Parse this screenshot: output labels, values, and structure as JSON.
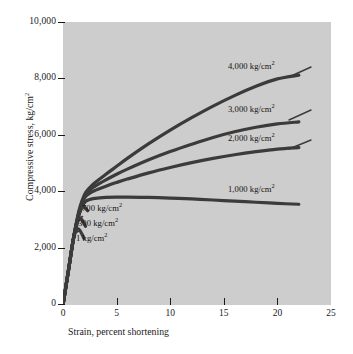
{
  "chart_data": {
    "type": "line",
    "title": "",
    "xlabel": "Strain, percent shortening",
    "ylabel": "Compressive stress, kg/cm2",
    "ylabel_display": "Compressive stress, kg/cm",
    "ylabel_sup": "2",
    "xlim": [
      0,
      25
    ],
    "ylim": [
      0,
      10000
    ],
    "xticks": [
      0,
      5,
      10,
      15,
      20,
      25
    ],
    "xtick_labels": [
      "0",
      "5",
      "10",
      "15",
      "20",
      "25"
    ],
    "yticks": [
      0,
      2000,
      4000,
      6000,
      8000,
      10000
    ],
    "ytick_labels": [
      "0",
      "2,000",
      "4,000",
      "6,000",
      "8,000",
      "10,000"
    ],
    "grid": false,
    "legend_position": "inline-annotations",
    "plot_background": "#cdcdcd",
    "line_color": "#3b3b3b",
    "series": [
      {
        "name": "4,000 kg/cm2",
        "label_text": "4,000 kg/cm",
        "label_sup": "2",
        "confining_pressure": 4000,
        "points": [
          [
            0.0,
            0
          ],
          [
            0.5,
            1200
          ],
          [
            1.0,
            2400
          ],
          [
            1.5,
            3350
          ],
          [
            2.0,
            3900
          ],
          [
            2.5,
            4150
          ],
          [
            3.0,
            4330
          ],
          [
            4.0,
            4620
          ],
          [
            5.0,
            4900
          ],
          [
            6.0,
            5180
          ],
          [
            8.0,
            5700
          ],
          [
            10.0,
            6180
          ],
          [
            12.0,
            6620
          ],
          [
            14.0,
            7030
          ],
          [
            16.0,
            7400
          ],
          [
            18.0,
            7730
          ],
          [
            20.0,
            7990
          ],
          [
            22.0,
            8120
          ]
        ]
      },
      {
        "name": "3,000 kg/cm2",
        "label_text": "3,000 kg/cm",
        "label_sup": "2",
        "confining_pressure": 3000,
        "points": [
          [
            0.0,
            0
          ],
          [
            0.5,
            1200
          ],
          [
            1.0,
            2400
          ],
          [
            1.5,
            3300
          ],
          [
            2.0,
            3830
          ],
          [
            2.5,
            4060
          ],
          [
            3.0,
            4200
          ],
          [
            4.0,
            4420
          ],
          [
            5.0,
            4620
          ],
          [
            6.0,
            4800
          ],
          [
            8.0,
            5130
          ],
          [
            10.0,
            5420
          ],
          [
            12.0,
            5680
          ],
          [
            14.0,
            5920
          ],
          [
            16.0,
            6120
          ],
          [
            18.0,
            6280
          ],
          [
            20.0,
            6400
          ],
          [
            22.0,
            6470
          ]
        ]
      },
      {
        "name": "2,000 kg/cm2",
        "label_text": "2,000 kg/cm",
        "label_sup": "2",
        "confining_pressure": 2000,
        "points": [
          [
            0.0,
            0
          ],
          [
            0.5,
            1200
          ],
          [
            1.0,
            2400
          ],
          [
            1.5,
            3250
          ],
          [
            2.0,
            3780
          ],
          [
            2.5,
            3950
          ],
          [
            3.0,
            4050
          ],
          [
            4.0,
            4200
          ],
          [
            5.0,
            4330
          ],
          [
            6.0,
            4450
          ],
          [
            8.0,
            4670
          ],
          [
            10.0,
            4860
          ],
          [
            12.0,
            5030
          ],
          [
            14.0,
            5180
          ],
          [
            16.0,
            5310
          ],
          [
            18.0,
            5420
          ],
          [
            20.0,
            5510
          ],
          [
            22.0,
            5560
          ]
        ]
      },
      {
        "name": "1,000 kg/cm2",
        "label_text": "1,000 kg/cm",
        "label_sup": "2",
        "confining_pressure": 1000,
        "points": [
          [
            0.0,
            0
          ],
          [
            0.5,
            1200
          ],
          [
            1.0,
            2400
          ],
          [
            1.5,
            3200
          ],
          [
            2.0,
            3620
          ],
          [
            2.5,
            3730
          ],
          [
            3.0,
            3770
          ],
          [
            4.0,
            3800
          ],
          [
            5.0,
            3810
          ],
          [
            6.0,
            3810
          ],
          [
            8.0,
            3800
          ],
          [
            10.0,
            3780
          ],
          [
            12.0,
            3750
          ],
          [
            14.0,
            3710
          ],
          [
            16.0,
            3670
          ],
          [
            18.0,
            3630
          ],
          [
            20.0,
            3590
          ],
          [
            22.0,
            3560
          ]
        ]
      },
      {
        "name": "700 kg/cm2",
        "label_text": "700 kg/cm",
        "label_sup": "2",
        "confining_pressure": 700,
        "points": [
          [
            0.0,
            0
          ],
          [
            0.5,
            1200
          ],
          [
            1.0,
            2400
          ],
          [
            1.4,
            3080
          ],
          [
            1.7,
            3400
          ],
          [
            1.9,
            3470
          ],
          [
            2.1,
            3420
          ],
          [
            2.3,
            3330
          ]
        ]
      },
      {
        "name": "300 kg/cm2",
        "label_text": "300 kg/cm",
        "label_sup": "2",
        "confining_pressure": 300,
        "points": [
          [
            0.0,
            0
          ],
          [
            0.5,
            1200
          ],
          [
            1.0,
            2400
          ],
          [
            1.3,
            2860
          ],
          [
            1.55,
            3060
          ],
          [
            1.75,
            3020
          ],
          [
            1.95,
            2900
          ],
          [
            2.1,
            2780
          ]
        ]
      },
      {
        "name": "1 kg/cm2",
        "label_text": "1 kg/cm",
        "label_sup": "2",
        "confining_pressure": 1,
        "points": [
          [
            0.0,
            0
          ],
          [
            0.5,
            1200
          ],
          [
            0.95,
            2280
          ],
          [
            1.2,
            2620
          ],
          [
            1.4,
            2700
          ],
          [
            1.6,
            2620
          ],
          [
            1.8,
            2480
          ],
          [
            1.95,
            2360
          ]
        ]
      }
    ],
    "annotations": [
      {
        "text": "4,000 kg/cm",
        "sup": "2",
        "at_x": 228,
        "at_y": 62
      },
      {
        "text": "3,000 kg/cm",
        "sup": "2",
        "at_x": 228,
        "at_y": 105
      },
      {
        "text": "2,000 kg/cm",
        "sup": "2",
        "at_x": 228,
        "at_y": 134
      },
      {
        "text": "1,000 kg/cm",
        "sup": "2",
        "at_x": 228,
        "at_y": 185
      },
      {
        "text": "700 kg/cm",
        "sup": "2",
        "at_x": 82,
        "at_y": 204
      },
      {
        "text": "300 kg/cm",
        "sup": "2",
        "at_x": 78,
        "at_y": 219
      },
      {
        "text": "1 kg/cm",
        "sup": "2",
        "at_x": 76,
        "at_y": 234
      }
    ]
  }
}
